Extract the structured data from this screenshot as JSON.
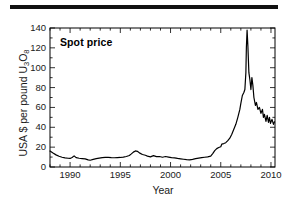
{
  "figure": {
    "rule_color": "#111111",
    "background": "#ffffff"
  },
  "chart_data": {
    "type": "line",
    "title": "",
    "legend_label": "Spot price",
    "legend_position": "top-left-inside",
    "xlabel": "Year",
    "ylabel": "USA $ per pound U3O8",
    "ylabel_parts": {
      "prefix": "USA $ per pound U",
      "sub1": "3",
      "mid": "O",
      "sub2": "8"
    },
    "xlim": [
      1988.0,
      2010.4
    ],
    "ylim": [
      0,
      140
    ],
    "xticks": [
      1990,
      1995,
      2000,
      2005,
      2010
    ],
    "xtick_labels": [
      "1990",
      "1995",
      "2000",
      "2005",
      "2010"
    ],
    "xminor_step": 1,
    "yticks": [
      0,
      20,
      40,
      60,
      80,
      100,
      120,
      140
    ],
    "ytick_labels": [
      "0",
      "20",
      "40",
      "60",
      "80",
      "100",
      "120",
      "140"
    ],
    "yminor_step": 10,
    "grid": false,
    "line_color": "#000000",
    "line_width": 1.2,
    "series": [
      {
        "name": "Spot price",
        "x": [
          1988.0,
          1988.3,
          1988.6,
          1988.9,
          1989.2,
          1989.5,
          1989.8,
          1990.0,
          1990.2,
          1990.4,
          1990.6,
          1990.9,
          1991.2,
          1991.5,
          1991.8,
          1992.0,
          1992.3,
          1992.6,
          1992.9,
          1993.2,
          1993.5,
          1993.8,
          1994.1,
          1994.4,
          1994.7,
          1995.0,
          1995.3,
          1995.6,
          1995.9,
          1996.1,
          1996.3,
          1996.5,
          1996.7,
          1996.9,
          1997.2,
          1997.5,
          1997.7,
          1998.0,
          1998.3,
          1998.6,
          1998.9,
          1999.2,
          1999.5,
          1999.8,
          2000.1,
          2000.4,
          2000.7,
          2001.0,
          2001.3,
          2001.6,
          2001.9,
          2002.2,
          2002.5,
          2002.8,
          2003.1,
          2003.4,
          2003.7,
          2004.0,
          2004.2,
          2004.4,
          2004.6,
          2004.8,
          2005.0,
          2005.1,
          2005.3,
          2005.5,
          2005.7,
          2005.9,
          2006.1,
          2006.3,
          2006.5,
          2006.7,
          2006.9,
          2007.0,
          2007.15,
          2007.3,
          2007.4,
          2007.5,
          2007.55,
          2007.62,
          2007.7,
          2007.8,
          2007.9,
          2008.0,
          2008.1,
          2008.2,
          2008.3,
          2008.45,
          2008.55,
          2008.7,
          2008.85,
          2009.0,
          2009.15,
          2009.25,
          2009.35,
          2009.5,
          2009.62,
          2009.75,
          2009.85,
          2009.95,
          2010.1,
          2010.25,
          2010.35
        ],
        "y": [
          16.0,
          14.0,
          12.2,
          10.8,
          9.8,
          9.2,
          8.8,
          8.6,
          9.6,
          11.2,
          9.4,
          8.8,
          8.5,
          8.2,
          7.2,
          6.8,
          7.6,
          8.4,
          9.0,
          9.4,
          9.6,
          9.6,
          9.4,
          9.3,
          9.5,
          9.6,
          10.0,
          10.6,
          11.6,
          13.2,
          15.0,
          16.2,
          15.8,
          14.2,
          12.6,
          11.8,
          11.0,
          10.2,
          11.4,
          10.4,
          10.6,
          9.8,
          10.6,
          10.0,
          9.4,
          9.2,
          8.6,
          8.2,
          7.8,
          7.4,
          7.2,
          7.6,
          8.4,
          9.0,
          9.4,
          9.8,
          10.2,
          11.0,
          13.5,
          16.5,
          18.5,
          19.6,
          20.4,
          23.0,
          23.6,
          24.5,
          26.5,
          29.0,
          33.0,
          38.0,
          43.0,
          50.0,
          58.0,
          64.0,
          72.0,
          75.0,
          78.0,
          95.0,
          120.0,
          138.0,
          122.0,
          95.0,
          88.0,
          78.0,
          90.0,
          82.0,
          70.0,
          62.0,
          65.0,
          58.0,
          60.0,
          54.0,
          58.0,
          50.0,
          53.0,
          46.0,
          52.0,
          45.0,
          50.0,
          44.0,
          48.0,
          43.0,
          45.5
        ]
      }
    ]
  }
}
